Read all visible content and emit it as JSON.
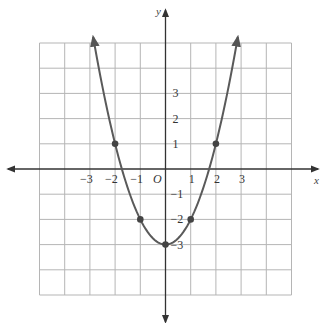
{
  "chart_data": {
    "type": "line",
    "title": "",
    "equation": "y = x^2 - 3",
    "xlabel": "x",
    "ylabel": "y",
    "origin_label": "O",
    "xlim": [
      -5,
      5
    ],
    "ylim": [
      -5,
      5
    ],
    "grid": true,
    "legend": null,
    "x_ticks": [
      -3,
      -2,
      -1,
      1,
      2,
      3
    ],
    "x_tick_labels": [
      "−3",
      "−2",
      "−1",
      "1",
      "2",
      "3"
    ],
    "y_ticks": [
      3,
      2,
      1,
      -1,
      -2,
      -3
    ],
    "y_tick_labels": [
      "3",
      "2",
      "1",
      "−1",
      "−2",
      "−3"
    ],
    "series": [
      {
        "name": "parabola",
        "curve": "y = x^2 - 3",
        "x_range": [
          -2.87,
          2.87
        ],
        "marked_points": [
          {
            "x": -2,
            "y": 1
          },
          {
            "x": -1,
            "y": -2
          },
          {
            "x": 0,
            "y": -3
          },
          {
            "x": 1,
            "y": -2
          },
          {
            "x": 2,
            "y": 1
          }
        ],
        "arrows_at_ends": true
      }
    ],
    "colors": {
      "curve": "#5a5a5a",
      "axes": "#333333",
      "grid": "#b5b5b5",
      "points": "#444444"
    }
  }
}
